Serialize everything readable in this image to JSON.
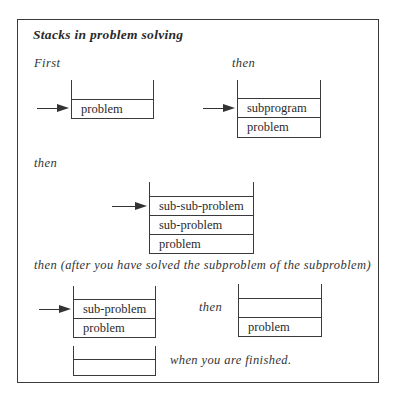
{
  "figure": {
    "title": "Stacks in problem solving",
    "labels": {
      "first": "First",
      "then_1": "then",
      "then_2": "then",
      "then_after": "then (after you have solved the subproblem of the subproblem)",
      "then_3": "then",
      "finished": "when you are finished."
    },
    "stacks": [
      {
        "id": "stack-1",
        "cells": [
          "problem"
        ],
        "pointer": true
      },
      {
        "id": "stack-2",
        "cells": [
          "subprogram",
          "problem"
        ],
        "pointer": true
      },
      {
        "id": "stack-3",
        "cells": [
          "sub-sub-problem",
          "sub-problem",
          "problem"
        ],
        "pointer": true
      },
      {
        "id": "stack-4",
        "cells": [
          "sub-problem",
          "problem"
        ],
        "pointer": true
      },
      {
        "id": "stack-5",
        "cells": [
          "",
          "problem"
        ],
        "pointer": false
      },
      {
        "id": "stack-6",
        "cells": [
          ""
        ],
        "pointer": false
      }
    ]
  },
  "colors": {
    "ink": "#2a2a2a",
    "background": "#ffffff"
  }
}
